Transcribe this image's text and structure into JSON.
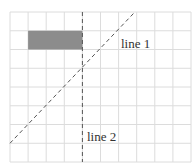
{
  "diagram": {
    "type": "grid-geometry",
    "grid": {
      "columns": 10,
      "rows": 8,
      "line_color": "#dcdcdc",
      "background": "#ffffff"
    },
    "shaded_rectangle": {
      "col_start": 1,
      "col_end": 4,
      "row_start": 1,
      "row_end": 2,
      "fill": "#8c8c8c"
    },
    "lines": [
      {
        "label": "line 1",
        "style": "dashed",
        "orientation": "diagonal",
        "from_grid": [
          0,
          7.0
        ],
        "to_grid": [
          6.9,
          0
        ],
        "color": "#555555"
      },
      {
        "label": "line 2",
        "style": "dashed",
        "orientation": "vertical",
        "x_grid": 4,
        "color": "#555555"
      }
    ]
  },
  "labels": {
    "line1": "line 1",
    "line2": "line 2"
  }
}
